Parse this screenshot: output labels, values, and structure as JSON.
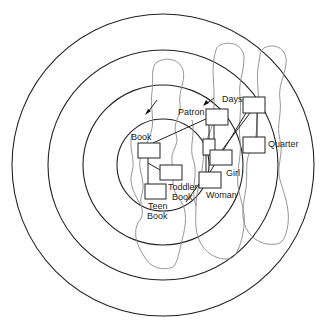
{
  "diagram": {
    "type": "concentric-rings-with-entity-boxes",
    "colors": {
      "ring": "#222222",
      "boundary_blob": "#8a8a8a",
      "box_fill": "#ffffff",
      "text": "#222222"
    },
    "rings": [
      {
        "id": "ring-outer",
        "cx": 163,
        "cy": 165,
        "r": 151
      },
      {
        "id": "ring-second",
        "cx": 163,
        "cy": 165,
        "r": 115
      },
      {
        "id": "ring-third",
        "cx": 163,
        "cy": 165,
        "r": 80
      },
      {
        "id": "ring-inner",
        "cx": 163,
        "cy": 165,
        "r": 46
      }
    ],
    "boxes": [
      {
        "id": "book",
        "x": 138,
        "y": 143,
        "w": 22,
        "h": 15
      },
      {
        "id": "toddler-book",
        "x": 160,
        "y": 165,
        "w": 22,
        "h": 15
      },
      {
        "id": "teen-book",
        "x": 145,
        "y": 184,
        "w": 21,
        "h": 15
      },
      {
        "id": "patron",
        "x": 206,
        "y": 109,
        "w": 22,
        "h": 16
      },
      {
        "id": "hidden-sub",
        "x": 203,
        "y": 139,
        "w": 12,
        "h": 16
      },
      {
        "id": "girl",
        "x": 210,
        "y": 150,
        "w": 22,
        "h": 15
      },
      {
        "id": "woman",
        "x": 199,
        "y": 172,
        "w": 22,
        "h": 16
      },
      {
        "id": "days",
        "x": 243,
        "y": 97,
        "w": 22,
        "h": 16
      },
      {
        "id": "quarter",
        "x": 243,
        "y": 137,
        "w": 22,
        "h": 16
      }
    ],
    "labels": [
      {
        "id": "book",
        "text": "Book",
        "x": 131,
        "y": 140
      },
      {
        "id": "toddler-1",
        "text": "Toddler",
        "x": 168,
        "y": 190
      },
      {
        "id": "toddler-2",
        "text": "Book",
        "x": 172,
        "y": 200
      },
      {
        "id": "teen-1",
        "text": "Teen",
        "x": 148,
        "y": 209
      },
      {
        "id": "teen-2",
        "text": "Book",
        "x": 147,
        "y": 219
      },
      {
        "id": "patron",
        "text": "Patron",
        "x": 178,
        "y": 115
      },
      {
        "id": "girl",
        "text": "Girl",
        "x": 226,
        "y": 176
      },
      {
        "id": "woman",
        "text": "Woman",
        "x": 206,
        "y": 198
      },
      {
        "id": "days",
        "text": "Days",
        "x": 222,
        "y": 102
      },
      {
        "id": "quarter",
        "text": "Quarter",
        "x": 268,
        "y": 147
      }
    ]
  }
}
